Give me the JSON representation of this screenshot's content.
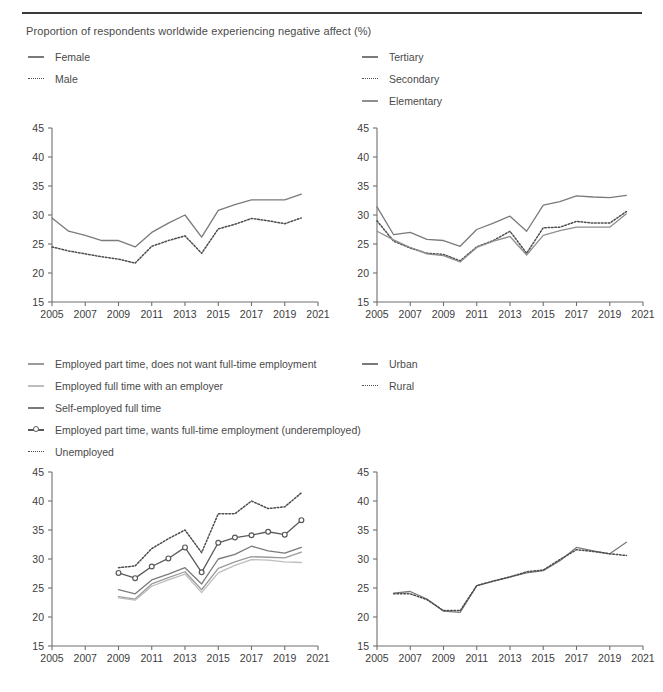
{
  "figure": {
    "title": "Proportion of respondents worldwide experiencing negative affect (%)"
  },
  "colors": {
    "dark": "#4d4d4d",
    "mid": "#7a7a7a",
    "light": "#a8a8a8",
    "lighter": "#bdbdbd",
    "axis": "#6f6f6f",
    "text": "#4a4a4a",
    "rule": "#3a3a3a"
  },
  "axes": {
    "y_ticks": [
      "45",
      "40",
      "35",
      "30",
      "25",
      "20",
      "15"
    ],
    "x_ticks": [
      "2005",
      "2007",
      "2009",
      "2011",
      "2013",
      "2015",
      "2017",
      "2019",
      "2021"
    ],
    "ylim": [
      15,
      45
    ],
    "xlim": [
      2005,
      2021
    ]
  },
  "legends": {
    "sex": [
      {
        "label": "Female",
        "style": "solid",
        "color": "#7a7a7a"
      },
      {
        "label": "Male",
        "style": "dotted",
        "color": "#4d4d4d"
      }
    ],
    "education": [
      {
        "label": "Tertiary",
        "style": "solid",
        "color": "#7a7a7a"
      },
      {
        "label": "Secondary",
        "style": "dotted",
        "color": "#4d4d4d"
      },
      {
        "label": "Elementary",
        "style": "solid",
        "color": "#8f8f8f"
      }
    ],
    "employment": [
      {
        "label": "Employed part time, does not want full-time employment",
        "style": "solid",
        "color": "#9a9a9a"
      },
      {
        "label": "Employed full time with an employer",
        "style": "solid",
        "color": "#bdbdbd"
      },
      {
        "label": "Self-employed full time",
        "style": "solid",
        "color": "#7a7a7a"
      },
      {
        "label": "Employed part time, wants full-time employment (underemployed)",
        "style": "marker",
        "color": "#5a5a5a"
      },
      {
        "label": "Unemployed",
        "style": "dotted",
        "color": "#4d4d4d"
      }
    ],
    "area": [
      {
        "label": "Urban",
        "style": "solid",
        "color": "#7a7a7a"
      },
      {
        "label": "Rural",
        "style": "dotted",
        "color": "#4d4d4d"
      }
    ]
  },
  "chart_data": [
    {
      "id": "sex",
      "type": "line",
      "title": "",
      "xlabel": "",
      "ylabel": "",
      "ylim": [
        15,
        45
      ],
      "xlim": [
        2005,
        2021
      ],
      "grid": false,
      "legend_position": "above-left",
      "x": [
        2005,
        2006,
        2007,
        2008,
        2009,
        2010,
        2011,
        2012,
        2013,
        2014,
        2015,
        2016,
        2017,
        2018,
        2019,
        2020
      ],
      "series": [
        {
          "name": "Female",
          "style": "solid",
          "color": "#7a7a7a",
          "values": [
            29.5,
            27.2,
            26.5,
            25.6,
            25.6,
            24.5,
            27.0,
            28.6,
            30.0,
            26.2,
            30.8,
            31.8,
            32.6,
            32.6,
            32.6,
            33.6
          ]
        },
        {
          "name": "Male",
          "style": "dotted",
          "color": "#4d4d4d",
          "values": [
            24.5,
            23.8,
            23.3,
            22.8,
            22.4,
            21.7,
            24.6,
            25.6,
            26.4,
            23.4,
            27.6,
            28.4,
            29.4,
            29.0,
            28.5,
            29.5
          ]
        }
      ]
    },
    {
      "id": "education",
      "type": "line",
      "title": "",
      "xlabel": "",
      "ylabel": "",
      "ylim": [
        15,
        45
      ],
      "xlim": [
        2005,
        2021
      ],
      "grid": false,
      "legend_position": "above-right",
      "x": [
        2005,
        2006,
        2007,
        2008,
        2009,
        2010,
        2011,
        2012,
        2013,
        2014,
        2015,
        2016,
        2017,
        2018,
        2019,
        2020
      ],
      "series": [
        {
          "name": "Tertiary",
          "style": "solid",
          "color": "#7a7a7a",
          "values": [
            31.4,
            26.6,
            27.0,
            25.8,
            25.6,
            24.6,
            27.5,
            28.6,
            29.8,
            27.2,
            31.7,
            32.3,
            33.3,
            33.1,
            33.0,
            33.4
          ]
        },
        {
          "name": "Secondary",
          "style": "dotted",
          "color": "#4d4d4d",
          "values": [
            29.0,
            25.5,
            24.3,
            23.4,
            23.2,
            22.1,
            24.5,
            25.6,
            27.2,
            23.4,
            27.8,
            27.9,
            28.9,
            28.6,
            28.6,
            30.6
          ]
        },
        {
          "name": "Elementary",
          "style": "solid",
          "color": "#8f8f8f",
          "values": [
            27.2,
            25.7,
            24.4,
            23.3,
            23.0,
            21.9,
            24.4,
            25.5,
            26.3,
            23.1,
            26.5,
            27.3,
            27.9,
            27.9,
            27.9,
            30.2
          ]
        }
      ]
    },
    {
      "id": "employment",
      "type": "line",
      "title": "",
      "xlabel": "",
      "ylabel": "",
      "ylim": [
        15,
        45
      ],
      "xlim": [
        2005,
        2021
      ],
      "grid": false,
      "legend_position": "above-left",
      "x": [
        2009,
        2010,
        2011,
        2012,
        2013,
        2014,
        2015,
        2016,
        2017,
        2018,
        2019,
        2020
      ],
      "series": [
        {
          "name": "Unemployed",
          "style": "dotted",
          "color": "#4d4d4d",
          "values": [
            28.5,
            28.8,
            31.8,
            33.5,
            35.0,
            31.1,
            37.8,
            37.8,
            40.0,
            38.7,
            39.0,
            41.4
          ]
        },
        {
          "name": "Employed part time, wants full-time employment (underemployed)",
          "style": "marker",
          "color": "#5a5a5a",
          "values": [
            27.6,
            26.7,
            28.7,
            30.1,
            32.0,
            27.7,
            32.8,
            33.7,
            34.1,
            34.7,
            34.2,
            36.7
          ]
        },
        {
          "name": "Self-employed full time",
          "style": "solid",
          "color": "#7a7a7a",
          "values": [
            24.7,
            24.0,
            26.4,
            27.4,
            28.5,
            25.7,
            30.0,
            30.8,
            32.2,
            31.4,
            31.0,
            32.0
          ]
        },
        {
          "name": "Employed part time, does not want full-time employment",
          "style": "solid",
          "color": "#9a9a9a",
          "values": [
            23.5,
            23.1,
            25.7,
            26.8,
            27.8,
            24.7,
            28.4,
            29.5,
            30.4,
            30.3,
            30.2,
            31.2
          ]
        },
        {
          "name": "Employed full time with an employer",
          "style": "solid",
          "color": "#bdbdbd",
          "values": [
            23.3,
            22.9,
            25.3,
            26.4,
            27.4,
            24.2,
            27.6,
            28.9,
            29.9,
            29.8,
            29.5,
            29.4
          ]
        }
      ]
    },
    {
      "id": "area",
      "type": "line",
      "title": "",
      "xlabel": "",
      "ylabel": "",
      "ylim": [
        15,
        45
      ],
      "xlim": [
        2005,
        2021
      ],
      "grid": false,
      "legend_position": "above-right",
      "x": [
        2006,
        2007,
        2008,
        2009,
        2010,
        2011,
        2012,
        2013,
        2014,
        2015,
        2016,
        2017,
        2018,
        2019,
        2020
      ],
      "series": [
        {
          "name": "Urban",
          "style": "solid",
          "color": "#7a7a7a",
          "values": [
            24.1,
            24.4,
            23.1,
            21.0,
            20.8,
            25.4,
            26.2,
            26.9,
            27.6,
            28.0,
            29.7,
            32.0,
            31.4,
            30.9,
            32.9
          ]
        },
        {
          "name": "Rural",
          "style": "dotted",
          "color": "#4d4d4d",
          "values": [
            24.0,
            24.0,
            23.0,
            21.1,
            21.1,
            25.4,
            26.2,
            26.9,
            27.8,
            28.1,
            29.9,
            31.6,
            31.3,
            30.9,
            30.6
          ]
        }
      ]
    }
  ]
}
